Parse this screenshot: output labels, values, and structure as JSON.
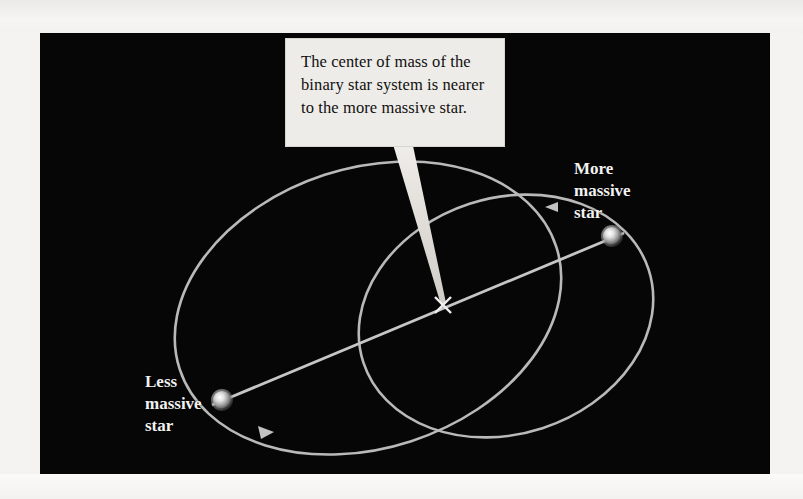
{
  "figure": {
    "background_color": "#060606",
    "page_color": "#f4f3f1",
    "orbit_color": "#b9b9b9",
    "callout": {
      "text": "The center of mass of the binary star system is nearer to the more massive star.",
      "background_color": "#eeece8",
      "text_color": "#101010"
    },
    "labels": {
      "more_massive": "More\nmassive\nstar",
      "less_massive": "Less\nmassive\nstar"
    },
    "markers": {
      "center_of_mass_symbol": "x",
      "center_of_mass_name": "center-of-mass-cross"
    },
    "stars": [
      {
        "name": "more-massive-star",
        "label": "More massive star",
        "cx": 612,
        "cy": 236,
        "r": 9
      },
      {
        "name": "less-massive-star",
        "label": "Less massive star",
        "cx": 222,
        "cy": 400,
        "r": 9
      }
    ],
    "orbits": [
      {
        "name": "less-massive-star-orbit",
        "description": "larger ellipse",
        "cx": 368,
        "cy": 308,
        "rx": 198,
        "ry": 140,
        "rotation_deg": -18
      },
      {
        "name": "more-massive-star-orbit",
        "description": "smaller ellipse",
        "cx": 506,
        "cy": 316,
        "rx": 150,
        "ry": 118,
        "rotation_deg": -18
      }
    ],
    "axis_line": {
      "name": "star-separation-line",
      "x1": 214,
      "y1": 402,
      "x2": 620,
      "y2": 233
    },
    "center_of_mass": {
      "x": 443,
      "y": 305
    },
    "direction_arrows": [
      {
        "name": "orbit-arrow-more-massive",
        "x": 549,
        "y": 205,
        "direction": "counterclockwise"
      },
      {
        "name": "orbit-arrow-less-massive",
        "x": 268,
        "y": 433,
        "direction": "counterclockwise"
      }
    ]
  }
}
